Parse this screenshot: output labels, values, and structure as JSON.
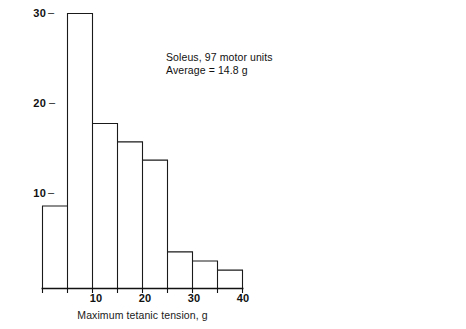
{
  "chart_data": {
    "type": "bar",
    "title": "",
    "subtitle": "",
    "xlabel": "Maximum tetanic tension, g",
    "ylabel": "Number of motor units",
    "categories": [
      "0-5",
      "5-10",
      "10-15",
      "15-20",
      "20-25",
      "25-30",
      "30-35",
      "35-40"
    ],
    "bin_edges": [
      0,
      5,
      10,
      15,
      20,
      25,
      30,
      35,
      40
    ],
    "values": [
      9,
      30,
      18,
      16,
      14,
      4,
      3,
      2
    ],
    "xlim": [
      0,
      40
    ],
    "ylim": [
      0,
      30
    ],
    "xticks": [
      10,
      20,
      30,
      40
    ],
    "yticks": [
      10,
      20,
      30
    ],
    "grid": false,
    "legend": false,
    "bar_style": "outline",
    "bar_fill": "#ffffff",
    "bar_stroke": "#1a1a1a",
    "annotations": [
      "Soleus, 97 motor units",
      "Average = 14.8 g"
    ]
  },
  "axes": {
    "y_ticks": [
      {
        "label": "30",
        "value": 30
      },
      {
        "label": "20",
        "value": 20
      },
      {
        "label": "10",
        "value": 10
      }
    ],
    "x_ticks": [
      {
        "label": "10",
        "value": 10
      },
      {
        "label": "20",
        "value": 20
      },
      {
        "label": "30",
        "value": 30
      },
      {
        "label": "40",
        "value": 40
      }
    ],
    "x_axis_title": "Maximum tetanic tension, g",
    "y_axis_title": "Number of motor units"
  },
  "annotation": {
    "line1": "Soleus, 97 motor units",
    "line2": "Average = 14.8 g"
  },
  "colors": {
    "background": "#ffffff",
    "ink": "#1a1a1a",
    "axis": "#111111"
  }
}
